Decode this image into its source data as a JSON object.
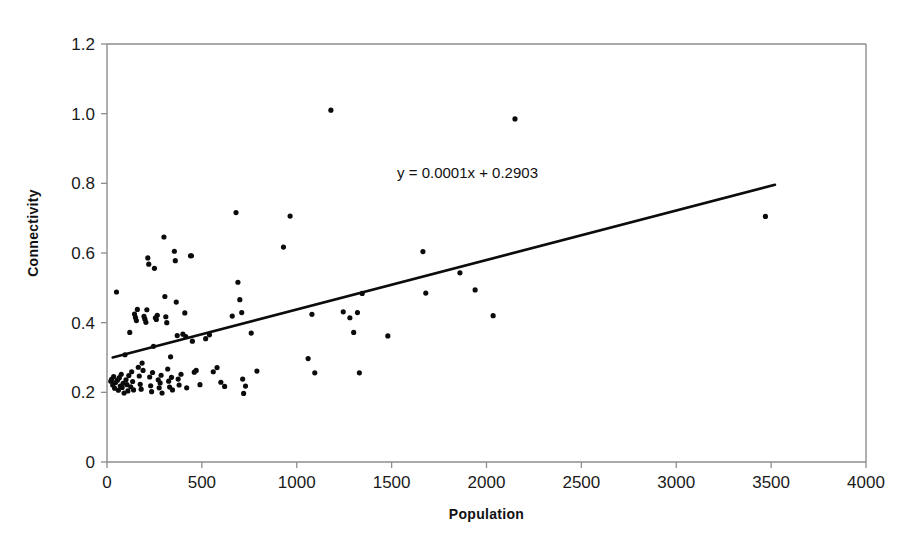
{
  "chart_data": {
    "type": "scatter",
    "title": "",
    "xlabel": "Population",
    "ylabel": "Connectivity",
    "xlim": [
      0,
      4000
    ],
    "ylim": [
      0,
      1.2
    ],
    "xticks": [
      0,
      500,
      1000,
      1500,
      2000,
      2500,
      3000,
      3500,
      4000
    ],
    "xtick_labels": [
      "0",
      "500",
      "1000",
      "1500",
      "2000",
      "2500",
      "3000",
      "3500",
      "4000"
    ],
    "yticks": [
      0,
      0.2,
      0.4,
      0.6,
      0.8,
      1.0,
      1.2
    ],
    "ytick_labels": [
      "0",
      "0.2",
      "0.4",
      "0.6",
      "0.8",
      "1.0",
      "1.2"
    ],
    "grid": false,
    "legend": "none",
    "marker": "filled-circle",
    "marker_color": "#0b0b0b",
    "marker_size": 4,
    "annotations": [
      {
        "name": "regression-equation",
        "text": "y = 0.0001x + 0.2903",
        "x": 1900,
        "y": 0.815
      }
    ],
    "trendline": {
      "type": "linear",
      "equation": "y = 0.0001x + 0.2903",
      "slope": 0.0001,
      "intercept": 0.2903,
      "x_start": 30,
      "x_end": 3520,
      "y_start": 0.3,
      "y_end": 0.796,
      "color": "#0c0c0c"
    },
    "series": [
      {
        "name": "settlements",
        "points": [
          [
            20,
            0.232
          ],
          [
            25,
            0.238
          ],
          [
            30,
            0.221
          ],
          [
            35,
            0.245
          ],
          [
            40,
            0.212
          ],
          [
            45,
            0.228
          ],
          [
            50,
            0.488
          ],
          [
            55,
            0.235
          ],
          [
            60,
            0.206
          ],
          [
            65,
            0.242
          ],
          [
            70,
            0.218
          ],
          [
            75,
            0.252
          ],
          [
            80,
            0.214
          ],
          [
            85,
            0.226
          ],
          [
            90,
            0.198
          ],
          [
            95,
            0.308
          ],
          [
            100,
            0.236
          ],
          [
            105,
            0.222
          ],
          [
            110,
            0.204
          ],
          [
            115,
            0.248
          ],
          [
            120,
            0.372
          ],
          [
            125,
            0.216
          ],
          [
            130,
            0.259
          ],
          [
            135,
            0.231
          ],
          [
            140,
            0.207
          ],
          [
            145,
            0.425
          ],
          [
            150,
            0.415
          ],
          [
            155,
            0.406
          ],
          [
            160,
            0.438
          ],
          [
            165,
            0.272
          ],
          [
            170,
            0.247
          ],
          [
            175,
            0.223
          ],
          [
            180,
            0.209
          ],
          [
            185,
            0.284
          ],
          [
            190,
            0.263
          ],
          [
            195,
            0.418
          ],
          [
            200,
            0.41
          ],
          [
            205,
            0.401
          ],
          [
            210,
            0.437
          ],
          [
            215,
            0.586
          ],
          [
            220,
            0.568
          ],
          [
            225,
            0.244
          ],
          [
            230,
            0.219
          ],
          [
            235,
            0.202
          ],
          [
            240,
            0.257
          ],
          [
            245,
            0.332
          ],
          [
            250,
            0.556
          ],
          [
            255,
            0.414
          ],
          [
            260,
            0.409
          ],
          [
            265,
            0.421
          ],
          [
            270,
            0.236
          ],
          [
            275,
            0.213
          ],
          [
            280,
            0.227
          ],
          [
            285,
            0.249
          ],
          [
            290,
            0.198
          ],
          [
            300,
            0.646
          ],
          [
            305,
            0.475
          ],
          [
            310,
            0.417
          ],
          [
            315,
            0.4
          ],
          [
            320,
            0.267
          ],
          [
            325,
            0.232
          ],
          [
            330,
            0.215
          ],
          [
            335,
            0.302
          ],
          [
            340,
            0.243
          ],
          [
            345,
            0.207
          ],
          [
            355,
            0.605
          ],
          [
            360,
            0.578
          ],
          [
            365,
            0.459
          ],
          [
            370,
            0.363
          ],
          [
            375,
            0.238
          ],
          [
            380,
            0.221
          ],
          [
            390,
            0.252
          ],
          [
            400,
            0.367
          ],
          [
            410,
            0.428
          ],
          [
            415,
            0.36
          ],
          [
            420,
            0.213
          ],
          [
            440,
            0.592
          ],
          [
            445,
            0.592
          ],
          [
            450,
            0.347
          ],
          [
            460,
            0.258
          ],
          [
            470,
            0.263
          ],
          [
            490,
            0.222
          ],
          [
            520,
            0.354
          ],
          [
            540,
            0.365
          ],
          [
            560,
            0.259
          ],
          [
            580,
            0.271
          ],
          [
            600,
            0.229
          ],
          [
            620,
            0.217
          ],
          [
            660,
            0.419
          ],
          [
            680,
            0.716
          ],
          [
            690,
            0.516
          ],
          [
            700,
            0.466
          ],
          [
            710,
            0.429
          ],
          [
            715,
            0.238
          ],
          [
            720,
            0.197
          ],
          [
            730,
            0.218
          ],
          [
            760,
            0.37
          ],
          [
            790,
            0.261
          ],
          [
            930,
            0.617
          ],
          [
            965,
            0.706
          ],
          [
            1060,
            0.297
          ],
          [
            1080,
            0.424
          ],
          [
            1095,
            0.256
          ],
          [
            1180,
            1.01
          ],
          [
            1245,
            0.431
          ],
          [
            1280,
            0.414
          ],
          [
            1300,
            0.372
          ],
          [
            1320,
            0.429
          ],
          [
            1330,
            0.256
          ],
          [
            1345,
            0.484
          ],
          [
            1480,
            0.362
          ],
          [
            1665,
            0.604
          ],
          [
            1680,
            0.485
          ],
          [
            1860,
            0.543
          ],
          [
            1940,
            0.494
          ],
          [
            2035,
            0.42
          ],
          [
            2150,
            0.985
          ],
          [
            3470,
            0.705
          ]
        ]
      }
    ]
  },
  "figure": {
    "background": "#ffffff",
    "axis_color": "#8d8d8d",
    "text_color": "#111111"
  }
}
